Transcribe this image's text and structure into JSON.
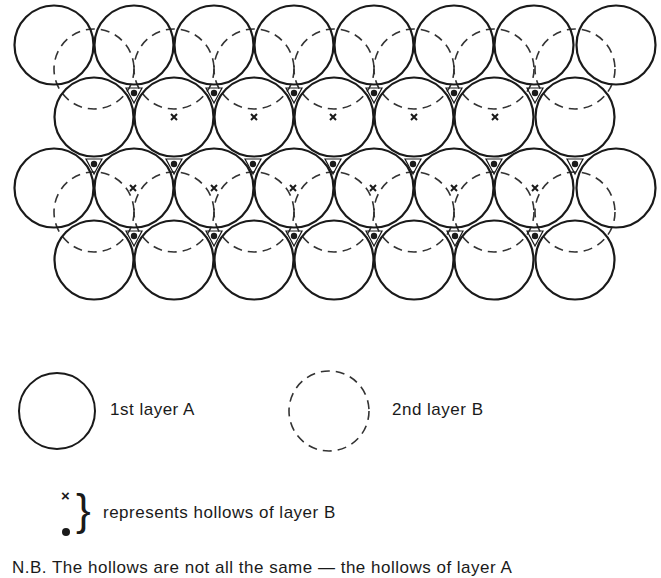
{
  "figure": {
    "colors": {
      "ink": "#1a1a1a",
      "background": "#ffffff"
    },
    "radius": 40,
    "layer_a_rows": [
      {
        "y": 45,
        "x": [
          54,
          134,
          214,
          294,
          374,
          454,
          534,
          616
        ]
      },
      {
        "y": 117,
        "x": [
          94,
          174,
          254,
          334,
          414,
          494,
          575
        ]
      },
      {
        "y": 188,
        "x": [
          54,
          134,
          214,
          294,
          374,
          454,
          534,
          616
        ]
      },
      {
        "y": 260,
        "x": [
          94,
          174,
          254,
          334,
          414,
          494,
          575
        ]
      }
    ],
    "layer_b_rows": [
      {
        "y": 69,
        "x": [
          94,
          174,
          254,
          334,
          414,
          494,
          575
        ]
      },
      {
        "y": 212,
        "x": [
          94,
          174,
          254,
          334,
          414,
          494,
          575
        ]
      }
    ],
    "hollow_dots": [
      {
        "y": 94,
        "x": [
          134,
          214,
          294,
          374,
          454,
          535
        ]
      },
      {
        "y": 165,
        "x": [
          94,
          174,
          253,
          333,
          413,
          494,
          575
        ]
      },
      {
        "y": 237,
        "x": [
          134,
          214,
          294,
          374,
          455,
          535
        ]
      }
    ],
    "hollow_crosses": [
      {
        "y": 117,
        "x": [
          174,
          254,
          333,
          414,
          495
        ]
      },
      {
        "y": 188,
        "x": [
          133,
          214,
          293,
          373,
          454,
          535
        ]
      }
    ]
  },
  "legend": {
    "layer_a": {
      "symbol": "solid-circle",
      "label": "1st layer A"
    },
    "layer_b": {
      "symbol": "dashed-circle",
      "label": "2nd layer B"
    },
    "hollows": {
      "cross_symbol": "×",
      "brace_symbol": "}",
      "label": "represents hollows of layer B"
    }
  },
  "note": {
    "text": "N.B. The hollows are not all the same — the hollows of layer A"
  }
}
